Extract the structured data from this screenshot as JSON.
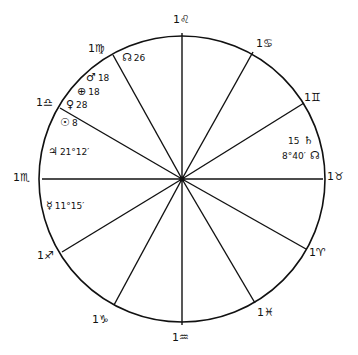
{
  "chart": {
    "type": "astrological-wheel",
    "center": [
      182,
      179
    ],
    "radius": 143,
    "line_color": "#111111",
    "background": "#ffffff"
  },
  "cusps": [
    {
      "label": "1♌",
      "sign": "Leo",
      "x": 182,
      "y": 33,
      "lx": 173,
      "ly": 14
    },
    {
      "label": "1♋",
      "sign": "Cancer",
      "x": 253,
      "y": 52,
      "lx": 256,
      "ly": 38
    },
    {
      "label": "1♊",
      "sign": "Gemini",
      "x": 304,
      "y": 103,
      "lx": 304,
      "ly": 92
    },
    {
      "label": "1♉",
      "sign": "Taurus",
      "x": 323,
      "y": 179,
      "lx": 327,
      "ly": 171
    },
    {
      "label": "1♈",
      "sign": "Aries",
      "x": 306,
      "y": 249,
      "lx": 309,
      "ly": 247
    },
    {
      "label": "1♓",
      "sign": "Pisces",
      "x": 255,
      "y": 303,
      "lx": 257,
      "ly": 307
    },
    {
      "label": "1♒",
      "sign": "Aquarius",
      "x": 182,
      "y": 325,
      "lx": 172,
      "ly": 332
    },
    {
      "label": "1♑",
      "sign": "Capricorn",
      "x": 114,
      "y": 305,
      "lx": 92,
      "ly": 314
    },
    {
      "label": "1♐",
      "sign": "Sagittarius",
      "x": 62,
      "y": 252,
      "lx": 37,
      "ly": 250
    },
    {
      "label": "1♏",
      "sign": "Scorpio",
      "x": 42,
      "y": 179,
      "lx": 13,
      "ly": 172
    },
    {
      "label": "1♎",
      "sign": "Libra",
      "x": 60,
      "y": 108,
      "lx": 36,
      "ly": 97
    },
    {
      "label": "1♍",
      "sign": "Virgo",
      "x": 113,
      "y": 55,
      "lx": 88,
      "ly": 43
    }
  ],
  "placements": [
    {
      "glyph": "☊",
      "value": "26",
      "name": "node",
      "x": 122,
      "y": 52
    },
    {
      "glyph": "♂",
      "value": "18",
      "name": "mars",
      "x": 86,
      "y": 72
    },
    {
      "glyph": "⊕",
      "value": "18",
      "name": "earth",
      "x": 77,
      "y": 86
    },
    {
      "glyph": "♀",
      "value": "28",
      "name": "venus",
      "x": 66,
      "y": 99
    },
    {
      "glyph": "☉",
      "value": "8",
      "name": "sun",
      "x": 60,
      "y": 117
    },
    {
      "glyph": "♃",
      "value": "21°12′",
      "name": "jupiter",
      "x": 48,
      "y": 146
    },
    {
      "glyph": "☿",
      "value": "11°15′",
      "name": "mercury",
      "x": 46,
      "y": 200
    },
    {
      "glyph": "♄",
      "value": "15",
      "name": "saturn",
      "x": 288,
      "y": 135,
      "order": "value-first"
    },
    {
      "glyph": "☊",
      "value": "8°40′",
      "name": "node-gemini",
      "x": 282,
      "y": 150,
      "order": "value-first"
    }
  ]
}
